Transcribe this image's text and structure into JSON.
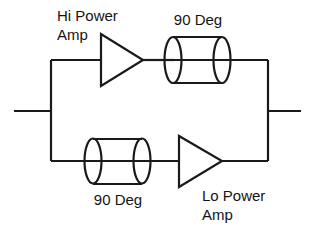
{
  "diagram": {
    "type": "schematic-block-diagram",
    "stroke_color": "#1a1a1a",
    "text_color": "#141414",
    "background_color": "#ffffff",
    "labels": {
      "hi_power_amp": "Hi Power\nAmp",
      "hi_power_amp_line1": "Hi Power",
      "hi_power_amp_line2": "Amp",
      "lo_power_amp": "Lo Power\nAmp",
      "lo_power_amp_line1": "Lo Power",
      "lo_power_amp_line2": "Amp",
      "top_hybrid": "90 Deg",
      "bottom_hybrid": "90 Deg"
    },
    "blocks": [
      {
        "name": "hi-power-amplifier",
        "shape": "triangle",
        "label": "Hi Power Amp",
        "branch": "top",
        "order": 1
      },
      {
        "name": "top-90-degree-hybrid",
        "shape": "cylinder",
        "label": "90 Deg",
        "branch": "top",
        "order": 2
      },
      {
        "name": "bottom-90-degree-hybrid",
        "shape": "cylinder",
        "label": "90 Deg",
        "branch": "bottom",
        "order": 1
      },
      {
        "name": "lo-power-amplifier",
        "shape": "triangle",
        "label": "Lo Power Amp",
        "branch": "bottom",
        "order": 2
      }
    ],
    "terminals": {
      "input": "left",
      "output": "right"
    }
  }
}
